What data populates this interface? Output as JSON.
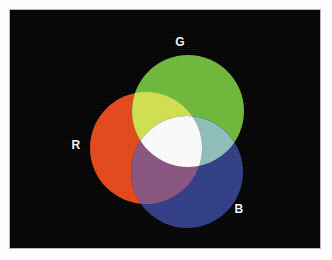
{
  "figure": {
    "background_color": "#040404",
    "plate": {
      "x": 10,
      "y": 10,
      "width": 310,
      "height": 238
    },
    "frame_color": "#b9b9b9",
    "page_color": "#fdfdfd"
  },
  "labels": {
    "red": "R",
    "green": "G",
    "blue": "B",
    "label_color": "#f2f2f2"
  },
  "chart_data": {
    "type": "diagram",
    "subtype": "venn-3-circle-additive-color",
    "background": "#040404",
    "circle_radius": 56,
    "circles": [
      {
        "name": "R",
        "label": "R",
        "cx": 136,
        "cy": 138,
        "r": 56,
        "color": "#e5491a"
      },
      {
        "name": "G",
        "label": "G",
        "cx": 178,
        "cy": 101,
        "r": 56,
        "color": "#70b93b"
      },
      {
        "name": "B",
        "label": "B",
        "cx": 177,
        "cy": 162,
        "r": 56,
        "color": "#303e86"
      }
    ],
    "intersections": [
      {
        "name": "R+G",
        "result": "Yellow",
        "color": "#d2e24f"
      },
      {
        "name": "G+B",
        "result": "Cyan",
        "color": "#8fc0bc"
      },
      {
        "name": "R+B",
        "result": "Magenta",
        "color": "#8a5580"
      },
      {
        "name": "R+G+B",
        "result": "White",
        "color": "#fdfdfb"
      }
    ],
    "label_positions": [
      {
        "label": "R",
        "x": 76,
        "y": 145
      },
      {
        "label": "G",
        "x": 180,
        "y": 42
      },
      {
        "label": "B",
        "x": 239,
        "y": 209
      }
    ]
  }
}
